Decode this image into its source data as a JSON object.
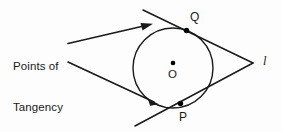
{
  "figure": {
    "title_text": "Points of Tangency",
    "annotation": {
      "line1": "Points of",
      "line2": "Tangency"
    },
    "labels": {
      "point_q": "Q",
      "point_p": "P",
      "center_o": "O",
      "line_l": "l"
    },
    "colors": {
      "stroke": "#1a1a1a",
      "text": "#1a1a1a",
      "background": "#fdfdfd",
      "point_fill": "#000000"
    },
    "geometry": {
      "circle": {
        "cx": 173,
        "cy": 68,
        "r": 40
      },
      "center_dot": {
        "cx": 173,
        "cy": 63,
        "r": 2.3
      },
      "tangency_point_q": {
        "cx": 186.5,
        "cy": 30.5,
        "r": 2.6
      },
      "tangency_point_p": {
        "cx": 180.5,
        "cy": 103.5,
        "r": 2.6
      },
      "external_vertex": {
        "x": 253,
        "y": 63
      },
      "tangent_line_upper": {
        "x1": 143,
        "y1": 10,
        "x2": 253,
        "y2": 63
      },
      "tangent_line_lower": {
        "x1": 135,
        "y1": 126,
        "x2": 253,
        "y2": 63
      },
      "leader_upper": {
        "x1": 68,
        "y1": 43,
        "x2": 152,
        "y2": 24
      },
      "leader_lower": {
        "x1": 68,
        "y1": 62,
        "x2": 158,
        "y2": 104
      }
    }
  }
}
